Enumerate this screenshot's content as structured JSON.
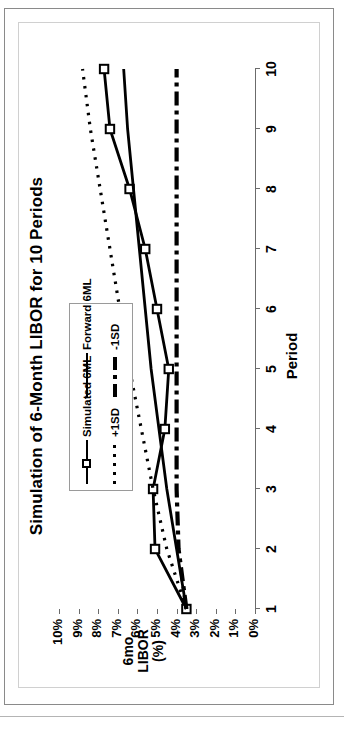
{
  "chart_data": {
    "type": "line",
    "title": "Simulation of 6-Month LIBOR for 10 Periods",
    "xlabel": "Period",
    "ylabel": "6mo LIBOR (%)",
    "ylabel_lines": [
      "6mo",
      "LIBOR",
      "(%)"
    ],
    "x": [
      1,
      2,
      3,
      4,
      5,
      6,
      7,
      8,
      9,
      10
    ],
    "xticklabels": [
      "1",
      "2",
      "3",
      "4",
      "5",
      "6",
      "7",
      "8",
      "9",
      "10"
    ],
    "yticks": [
      10,
      9,
      8,
      7,
      6,
      5,
      4,
      3,
      2,
      1,
      0
    ],
    "yticklabels": [
      "10%",
      "9%",
      "8%",
      "7%",
      "6%",
      "5%",
      "4%",
      "3%",
      "2%",
      "1%",
      "0%"
    ],
    "ylim": [
      0,
      10
    ],
    "xlim": [
      1,
      10
    ],
    "grid": false,
    "legend_position": "upper-left-inside",
    "series": [
      {
        "name": "Simulated 6ML",
        "style": "solid-with-square-markers",
        "color": "#000000",
        "values": [
          3.5,
          5.1,
          5.2,
          4.6,
          4.4,
          5.0,
          5.6,
          6.4,
          7.4,
          7.7
        ]
      },
      {
        "name": "Forward 6ML",
        "style": "solid",
        "color": "#000000",
        "values": [
          3.5,
          4.0,
          4.5,
          4.9,
          5.3,
          5.6,
          5.9,
          6.2,
          6.5,
          6.7
        ]
      },
      {
        "name": "+1SD",
        "style": "dotted",
        "color": "#000000",
        "values": [
          3.5,
          4.5,
          5.2,
          5.8,
          6.4,
          6.9,
          7.4,
          7.9,
          8.4,
          8.8
        ]
      },
      {
        "name": "-1SD",
        "style": "dash-dot",
        "color": "#000000",
        "values": [
          3.5,
          3.9,
          4.0,
          4.0,
          4.0,
          4.0,
          4.0,
          4.0,
          4.0,
          4.0
        ]
      }
    ]
  },
  "legend": {
    "items": [
      {
        "label": "Simulated 6ML",
        "key": "solid-square-marker"
      },
      {
        "label": "Forward 6ML",
        "key": "solid-line"
      },
      {
        "label": "+1SD",
        "key": "dotted-line"
      },
      {
        "label": "-1SD",
        "key": "dash-dot-line"
      }
    ]
  }
}
